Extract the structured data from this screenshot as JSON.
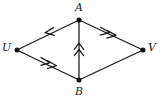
{
  "figure": {
    "type": "directed-graph-diagram",
    "background_color": "#ffffff",
    "line_color": "#1a1a1a",
    "vertex_color": "#101010",
    "width": 160,
    "height": 102
  },
  "vertices": [
    {
      "id": "A",
      "label": "A",
      "x": 79,
      "y": 20,
      "label_x": 75,
      "label_y": 2
    },
    {
      "id": "U",
      "label": "U",
      "x": 17,
      "y": 50,
      "label_x": 2,
      "label_y": 42
    },
    {
      "id": "V",
      "label": "V",
      "x": 143,
      "y": 50,
      "label_x": 148,
      "label_y": 42
    },
    {
      "id": "B",
      "label": "B",
      "x": 79,
      "y": 80,
      "label_x": 75,
      "label_y": 86
    }
  ],
  "edges": [
    {
      "id": "A-U",
      "from": "A",
      "to": "U",
      "arrow": "single",
      "direction": "A-to-U"
    },
    {
      "id": "A-V",
      "from": "A",
      "to": "V",
      "arrow": "double",
      "direction": "A-to-V"
    },
    {
      "id": "U-B",
      "from": "U",
      "to": "B",
      "arrow": "double",
      "direction": "U-to-B"
    },
    {
      "id": "B-V",
      "from": "B",
      "to": "V",
      "arrow": "none",
      "direction": "undirected"
    },
    {
      "id": "B-A",
      "from": "B",
      "to": "A",
      "arrow": "double",
      "direction": "B-to-A"
    }
  ]
}
